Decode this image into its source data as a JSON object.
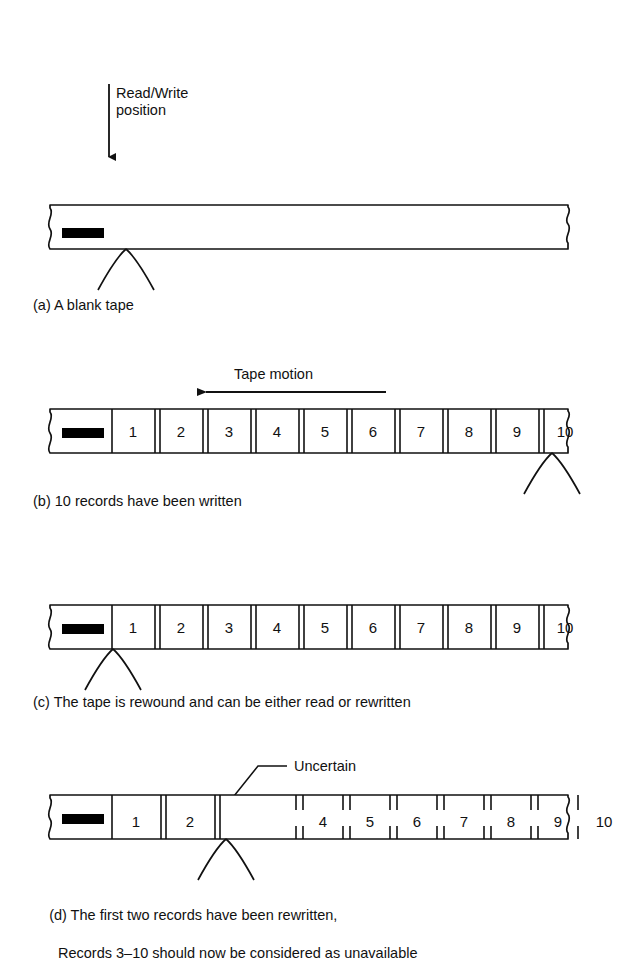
{
  "figure": {
    "ink_color": "#111111",
    "tape_fill": "#ffffff",
    "marker_color": "#000000"
  },
  "annotations": {
    "read_write_position": "Read/Write\nposition",
    "read_write_line1": "Read/Write",
    "read_write_line2": "position",
    "tape_motion": "Tape motion",
    "uncertain": "Uncertain"
  },
  "panels": [
    {
      "id": "a",
      "caption": "(a) A blank tape",
      "records": [],
      "pointer": "left",
      "note": "blank tape with load-point marker only"
    },
    {
      "id": "b",
      "caption": "(b) 10 records have been written",
      "records": [
        "1",
        "2",
        "3",
        "4",
        "5",
        "6",
        "7",
        "8",
        "9",
        "10"
      ],
      "pointer": "right",
      "separator_style": "solid",
      "note": "tape motion arrow points left"
    },
    {
      "id": "c",
      "caption": "(c) The tape is rewound and can be either read or rewritten",
      "records": [
        "1",
        "2",
        "3",
        "4",
        "5",
        "6",
        "7",
        "8",
        "9",
        "10"
      ],
      "pointer": "left",
      "separator_style": "solid"
    },
    {
      "id": "d",
      "caption_line1": "(d) The first two records have been rewritten,",
      "caption_line2": "Records 3–10 should now be considered as unavailable",
      "rewritten_records": [
        "1",
        "2"
      ],
      "uncertain_gap": true,
      "stale_records": [
        "4",
        "5",
        "6",
        "7",
        "8",
        "9",
        "10"
      ],
      "missing_record": "3",
      "pointer": "uncertain-gap",
      "separator_style_rewritten": "solid",
      "separator_style_stale": "dashed"
    }
  ],
  "record_numbers": {
    "b": [
      "1",
      "2",
      "3",
      "4",
      "5",
      "6",
      "7",
      "8",
      "9",
      "10"
    ],
    "c": [
      "1",
      "2",
      "3",
      "4",
      "5",
      "6",
      "7",
      "8",
      "9",
      "10"
    ],
    "d_new": [
      "1",
      "2"
    ],
    "d_old": [
      "4",
      "5",
      "6",
      "7",
      "8",
      "9",
      "10"
    ]
  }
}
